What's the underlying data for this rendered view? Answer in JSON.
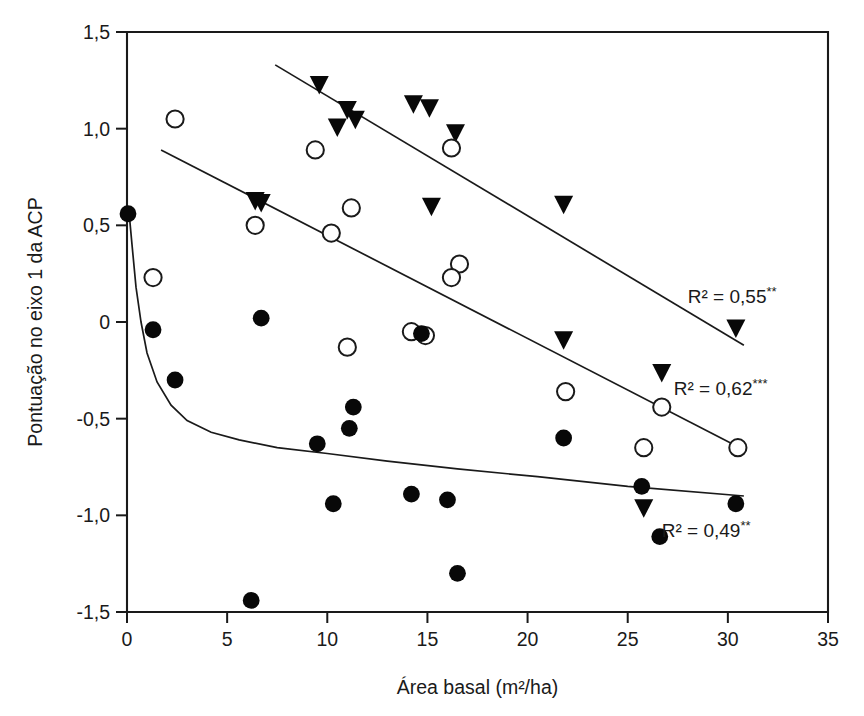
{
  "chart_data": {
    "type": "scatter",
    "title": "",
    "xlabel": "Área basal (m²/ha)",
    "ylabel": "Pontuação no eixo 1 da ACP",
    "xlim": [
      0,
      35
    ],
    "ylim": [
      -1.5,
      1.5
    ],
    "xticks": [
      "0",
      "5",
      "10",
      "15",
      "20",
      "25",
      "30",
      "35"
    ],
    "xtick_values": [
      0,
      5,
      10,
      15,
      20,
      25,
      30,
      35
    ],
    "yticks": [
      "1,5",
      "1,0",
      "0,5",
      "0",
      "-0,5",
      "-1,0",
      "-1,5"
    ],
    "ytick_values": [
      1.5,
      1.0,
      0.5,
      0,
      -0.5,
      -1.0,
      -1.5
    ],
    "grid": false,
    "legend_position": "none",
    "decimal_separator": ",",
    "series": [
      {
        "name": "triangle-series",
        "marker": "filled-down-triangle",
        "color": "#080808",
        "points": [
          [
            9.6,
            1.23
          ],
          [
            10.5,
            1.01
          ],
          [
            11.0,
            1.1
          ],
          [
            11.4,
            1.05
          ],
          [
            14.3,
            1.13
          ],
          [
            15.1,
            1.11
          ],
          [
            16.4,
            0.98
          ],
          [
            6.4,
            0.63
          ],
          [
            6.7,
            0.62
          ],
          [
            15.2,
            0.6
          ],
          [
            21.8,
            0.61
          ],
          [
            21.8,
            -0.09
          ],
          [
            26.7,
            -0.26
          ],
          [
            30.4,
            -0.03
          ],
          [
            25.8,
            -0.96
          ]
        ]
      },
      {
        "name": "open-circle-series",
        "marker": "open-circle",
        "color": "#ffffff",
        "points": [
          [
            2.4,
            1.05
          ],
          [
            9.4,
            0.89
          ],
          [
            16.2,
            0.9
          ],
          [
            6.4,
            0.5
          ],
          [
            11.2,
            0.59
          ],
          [
            10.2,
            0.46
          ],
          [
            16.6,
            0.3
          ],
          [
            16.2,
            0.23
          ],
          [
            1.3,
            0.23
          ],
          [
            11.0,
            -0.13
          ],
          [
            14.2,
            -0.05
          ],
          [
            21.9,
            -0.36
          ],
          [
            26.7,
            -0.44
          ],
          [
            25.8,
            -0.65
          ],
          [
            30.5,
            -0.65
          ],
          [
            14.9,
            -0.07
          ]
        ]
      },
      {
        "name": "filled-circle-series",
        "marker": "filled-circle",
        "color": "#080808",
        "points": [
          [
            0.05,
            0.56
          ],
          [
            1.3,
            -0.04
          ],
          [
            2.4,
            -0.3
          ],
          [
            6.7,
            0.02
          ],
          [
            9.5,
            -0.63
          ],
          [
            11.3,
            -0.44
          ],
          [
            11.1,
            -0.55
          ],
          [
            14.7,
            -0.06
          ],
          [
            10.3,
            -0.94
          ],
          [
            14.2,
            -0.89
          ],
          [
            16.0,
            -0.92
          ],
          [
            21.8,
            -0.6
          ],
          [
            25.7,
            -0.85
          ],
          [
            30.4,
            -0.94
          ],
          [
            26.6,
            -1.11
          ],
          [
            16.5,
            -1.3
          ],
          [
            6.2,
            -1.44
          ]
        ]
      }
    ],
    "fits": [
      {
        "name": "upper-regression-line",
        "type": "linear",
        "x_start": 7.4,
        "y_start": 1.33,
        "x_end": 30.8,
        "y_end": -0.12,
        "r2_label": "R² = 0,55",
        "significance": "**",
        "label_x": 28.0,
        "label_y": 0.1
      },
      {
        "name": "middle-regression-line",
        "type": "linear",
        "x_start": 1.7,
        "y_start": 0.89,
        "x_end": 30.6,
        "y_end": -0.65,
        "r2_label": "R² = 0,62",
        "significance": "***",
        "label_x": 27.3,
        "label_y": -0.38
      },
      {
        "name": "lower-decay-curve",
        "type": "exponential-decay",
        "x_start": 0.1,
        "y_start": 0.56,
        "x_end": 30.8,
        "y_end": -0.9,
        "r2_label": "R² = 0,49",
        "significance": "**",
        "label_x": 26.7,
        "label_y": -1.11,
        "path_points": [
          [
            0.1,
            0.57
          ],
          [
            0.25,
            0.4
          ],
          [
            0.45,
            0.18
          ],
          [
            0.7,
            0.0
          ],
          [
            1.0,
            -0.16
          ],
          [
            1.5,
            -0.31
          ],
          [
            2.2,
            -0.43
          ],
          [
            3.0,
            -0.51
          ],
          [
            4.2,
            -0.57
          ],
          [
            5.6,
            -0.61
          ],
          [
            7.5,
            -0.65
          ],
          [
            10.0,
            -0.68
          ],
          [
            13.0,
            -0.72
          ],
          [
            16.5,
            -0.76
          ],
          [
            20.5,
            -0.8
          ],
          [
            25.0,
            -0.85
          ],
          [
            30.8,
            -0.9
          ]
        ]
      }
    ],
    "annotations": [
      {
        "text": "R² = 0,55",
        "sup": "**",
        "x": 28.0,
        "y": 0.1
      },
      {
        "text": "R² = 0,62",
        "sup": "***",
        "x": 27.3,
        "y": -0.38
      },
      {
        "text": "R² = 0,49",
        "sup": "**",
        "x": 26.7,
        "y": -1.11
      }
    ]
  }
}
